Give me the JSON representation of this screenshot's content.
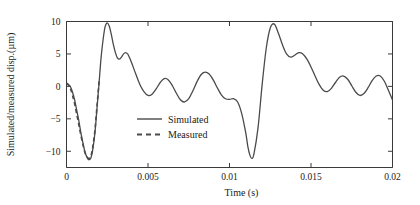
{
  "chart_data": {
    "type": "line",
    "title": "",
    "xlabel": "Time (s)",
    "ylabel": "Simulated/measured disp.(µm)",
    "xlim": [
      0,
      0.02
    ],
    "ylim": [
      -12.5,
      10
    ],
    "xticks": [
      0,
      0.005,
      0.01,
      0.015,
      0.02
    ],
    "xticklabels": [
      "0",
      "0.005",
      "0.01",
      "0.015",
      "0.02"
    ],
    "yticks": [
      -10,
      -5,
      0,
      5,
      10
    ],
    "yticklabels": [
      "−10",
      "−5",
      "0",
      "5",
      "10"
    ],
    "grid": false,
    "legend_position": "center-left",
    "line_color": "#4a4a4a",
    "series": [
      {
        "name": "Simulated",
        "style": "solid",
        "x": [
          0.0,
          0.00012,
          0.00025,
          0.00037,
          0.0005,
          0.00062,
          0.00075,
          0.00087,
          0.001,
          0.00112,
          0.00125,
          0.00137,
          0.0015,
          0.00162,
          0.00175,
          0.00187,
          0.002,
          0.00212,
          0.00225,
          0.00237,
          0.0025,
          0.00262,
          0.00275,
          0.00287,
          0.003,
          0.00312,
          0.00325,
          0.00337,
          0.0035,
          0.00362,
          0.00375,
          0.00387,
          0.004,
          0.00425,
          0.0045,
          0.00475,
          0.005,
          0.00525,
          0.0055,
          0.00575,
          0.006,
          0.00625,
          0.0065,
          0.00675,
          0.007,
          0.00725,
          0.0075,
          0.00775,
          0.008,
          0.00825,
          0.0085,
          0.00875,
          0.009,
          0.00925,
          0.0095,
          0.00975,
          0.01,
          0.01025,
          0.0105,
          0.01075,
          0.011,
          0.01112,
          0.01125,
          0.01137,
          0.0115,
          0.01175,
          0.012,
          0.01225,
          0.0125,
          0.01275,
          0.013,
          0.01325,
          0.0135,
          0.01375,
          0.014,
          0.01425,
          0.0145,
          0.01475,
          0.015,
          0.01525,
          0.0155,
          0.01575,
          0.016,
          0.01625,
          0.0165,
          0.01675,
          0.017,
          0.01725,
          0.0175,
          0.01775,
          0.018,
          0.01825,
          0.0185,
          0.01875,
          0.019,
          0.01925,
          0.0195,
          0.01975,
          0.02
        ],
        "y": [
          0.4,
          0.3,
          -0.1,
          -0.9,
          -2.1,
          -3.6,
          -5.2,
          -7.0,
          -8.6,
          -10.0,
          -10.9,
          -11.3,
          -11.0,
          -9.6,
          -7.0,
          -3.4,
          0.6,
          4.4,
          7.3,
          9.2,
          9.8,
          9.3,
          8.0,
          6.5,
          5.2,
          4.4,
          4.2,
          4.5,
          5.0,
          5.2,
          5.0,
          4.4,
          3.6,
          1.9,
          0.3,
          -0.8,
          -1.4,
          -1.2,
          -0.4,
          0.6,
          1.2,
          1.0,
          0.1,
          -1.1,
          -2.1,
          -2.4,
          -1.9,
          -0.7,
          0.7,
          1.8,
          2.2,
          1.9,
          1.0,
          -0.2,
          -1.3,
          -1.9,
          -2.0,
          -1.9,
          -2.4,
          -4.2,
          -7.2,
          -9.2,
          -10.6,
          -11.1,
          -10.4,
          -6.4,
          0.2,
          5.8,
          9.0,
          9.6,
          8.2,
          6.4,
          5.0,
          4.5,
          4.8,
          5.2,
          5.0,
          4.2,
          3.0,
          1.6,
          0.3,
          -0.6,
          -0.8,
          -0.3,
          0.6,
          1.4,
          1.6,
          1.1,
          0.1,
          -0.9,
          -1.4,
          -1.1,
          -0.2,
          0.9,
          1.6,
          1.6,
          0.8,
          -0.6,
          -2.1
        ]
      },
      {
        "name": "Measured",
        "style": "dashed",
        "x": [
          0.0,
          0.00012,
          0.00025,
          0.00037,
          0.0005,
          0.00062,
          0.00075,
          0.00087,
          0.001,
          0.00112,
          0.00125,
          0.00137,
          0.0015,
          0.00162,
          0.00175,
          0.00187,
          0.002,
          0.00212,
          0.00225,
          0.00237,
          0.0025,
          0.00262,
          0.00275,
          0.00287,
          0.003,
          0.00312,
          0.00325,
          0.00337,
          0.0035,
          0.00362,
          0.00375,
          0.00387,
          0.004,
          0.00425,
          0.0045,
          0.00475,
          0.005,
          0.00525,
          0.0055,
          0.00575,
          0.006,
          0.00625,
          0.0065,
          0.00675,
          0.007,
          0.00725,
          0.0075,
          0.00775,
          0.008,
          0.00825,
          0.0085,
          0.00875,
          0.009,
          0.00925,
          0.0095,
          0.00975,
          0.01,
          0.01025,
          0.0105,
          0.01075,
          0.011,
          0.01112,
          0.01125,
          0.01137,
          0.0115,
          0.01175,
          0.012,
          0.01225,
          0.0125,
          0.01275,
          0.013,
          0.01325,
          0.0135,
          0.01375,
          0.014,
          0.01425,
          0.0145,
          0.01475,
          0.015,
          0.01525,
          0.0155,
          0.01575,
          0.016,
          0.01625,
          0.0165,
          0.01675,
          0.017,
          0.01725,
          0.0175,
          0.01775,
          0.018,
          0.01825,
          0.0185,
          0.01875,
          0.019,
          0.01925,
          0.0195,
          0.01975,
          0.02
        ],
        "y": [
          0.5,
          0.2,
          -0.4,
          -1.4,
          -2.7,
          -4.2,
          -5.8,
          -7.4,
          -8.9,
          -10.1,
          -10.8,
          -11.1,
          -10.7,
          -9.2,
          -6.6,
          -3.1,
          0.8,
          4.5,
          7.3,
          9.1,
          9.7,
          9.2,
          7.9,
          6.4,
          5.2,
          4.4,
          4.2,
          4.5,
          5.0,
          5.2,
          5.0,
          4.4,
          3.6,
          1.9,
          0.3,
          -0.8,
          -1.4,
          -1.2,
          -0.4,
          0.6,
          1.2,
          1.0,
          0.1,
          -1.1,
          -2.1,
          -2.4,
          -1.9,
          -0.7,
          0.7,
          1.8,
          2.2,
          1.9,
          1.0,
          -0.2,
          -1.3,
          -1.9,
          -2.0,
          -1.9,
          -2.4,
          -4.2,
          -7.2,
          -9.2,
          -10.6,
          -11.1,
          -10.4,
          -6.4,
          0.2,
          5.8,
          9.0,
          9.6,
          8.2,
          6.4,
          5.0,
          4.5,
          4.8,
          5.2,
          5.0,
          4.2,
          3.0,
          1.6,
          0.3,
          -0.6,
          -0.8,
          -0.3,
          0.6,
          1.4,
          1.6,
          1.1,
          0.1,
          -0.9,
          -1.4,
          -1.1,
          -0.2,
          0.9,
          1.6,
          1.6,
          0.8,
          -0.6,
          -2.1
        ]
      }
    ],
    "legend": [
      {
        "label": "Simulated",
        "style": "solid"
      },
      {
        "label": "Measured",
        "style": "dashed"
      }
    ]
  }
}
